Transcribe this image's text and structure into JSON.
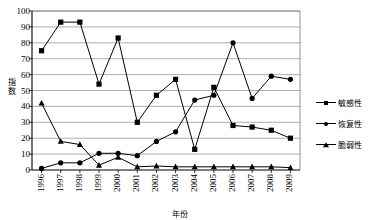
{
  "watermark": "",
  "legend": {
    "position": "right",
    "items": [
      {
        "label": "敏感性",
        "marker": "square-marker"
      },
      {
        "label": "恢复性",
        "marker": "circle-marker"
      },
      {
        "label": "脆弱性",
        "marker": "triangle-marker"
      }
    ]
  },
  "axes": {
    "ylabel": "指数",
    "ylabel_chars": [
      "指",
      "数"
    ],
    "xlabel": "年份",
    "yticks": [
      "0",
      "10",
      "20",
      "30",
      "40",
      "50",
      "60",
      "70",
      "80",
      "90",
      "100"
    ]
  },
  "chart_data": {
    "type": "line",
    "title": "",
    "xlabel": "年份",
    "ylabel": "指数",
    "ylim": [
      0,
      100
    ],
    "grid": true,
    "legend_position": "right",
    "categories": [
      "1996",
      "1997",
      "1998",
      "1999",
      "2000",
      "2001",
      "2002",
      "2003",
      "2004",
      "2005",
      "2006",
      "2007",
      "2008",
      "2009"
    ],
    "series": [
      {
        "name": "敏感性",
        "marker": "square",
        "values": [
          75,
          93,
          93,
          54,
          83,
          30,
          47,
          57,
          13,
          52,
          28,
          27,
          25,
          20
        ]
      },
      {
        "name": "恢复性",
        "marker": "circle",
        "values": [
          1,
          4.5,
          4.5,
          10.5,
          10.5,
          9,
          18,
          24,
          44,
          47,
          80,
          45,
          59,
          57
        ]
      },
      {
        "name": "脆弱性",
        "marker": "triangle",
        "values": [
          42,
          18,
          16,
          3,
          8,
          2,
          2.5,
          2,
          2,
          2,
          2,
          2,
          2,
          1.5
        ]
      }
    ]
  }
}
